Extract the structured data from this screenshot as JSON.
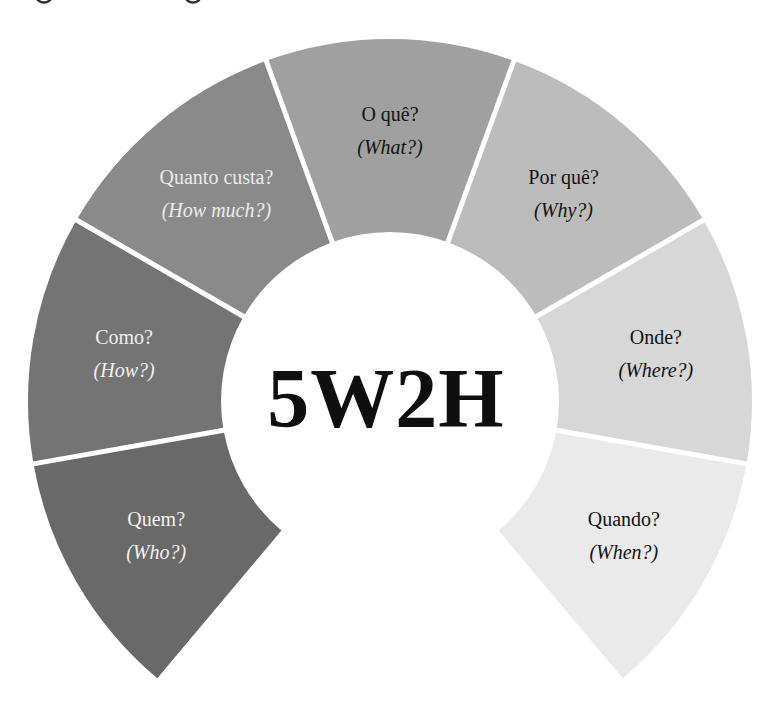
{
  "title": "5W2H",
  "caption_fragments": {
    "description": "bottom slivers of a cropped caption text line at the very top edge",
    "xs": [
      44,
      193
    ]
  },
  "chart_data": {
    "type": "donut-diagram",
    "center": {
      "x": 390,
      "y": 401
    },
    "outer_radius": 362,
    "inner_radius": 169,
    "start_angle": 130,
    "segment_angle": 40,
    "label_radius": 270,
    "separator_color": "#ffffff",
    "segments": [
      {
        "pt": "Quem?",
        "en": "(Who?)",
        "color": "#696969",
        "text_color": "#f2f2f2"
      },
      {
        "pt": "Como?",
        "en": "(How?)",
        "color": "#747474",
        "text_color": "#efefef"
      },
      {
        "pt": "Quanto custa?",
        "en": "(How much?)",
        "color": "#8a8a8a",
        "text_color": "#ebebeb"
      },
      {
        "pt": "O quê?",
        "en": "(What?)",
        "color": "#a0a0a0",
        "text_color": "#141414"
      },
      {
        "pt": "Por quê?",
        "en": "(Why?)",
        "color": "#bcbcbc",
        "text_color": "#141414"
      },
      {
        "pt": "Onde?",
        "en": "(Where?)",
        "color": "#d7d7d7",
        "text_color": "#141414"
      },
      {
        "pt": "Quando?",
        "en": "(When?)",
        "color": "#eaeaea",
        "text_color": "#141414"
      }
    ]
  }
}
